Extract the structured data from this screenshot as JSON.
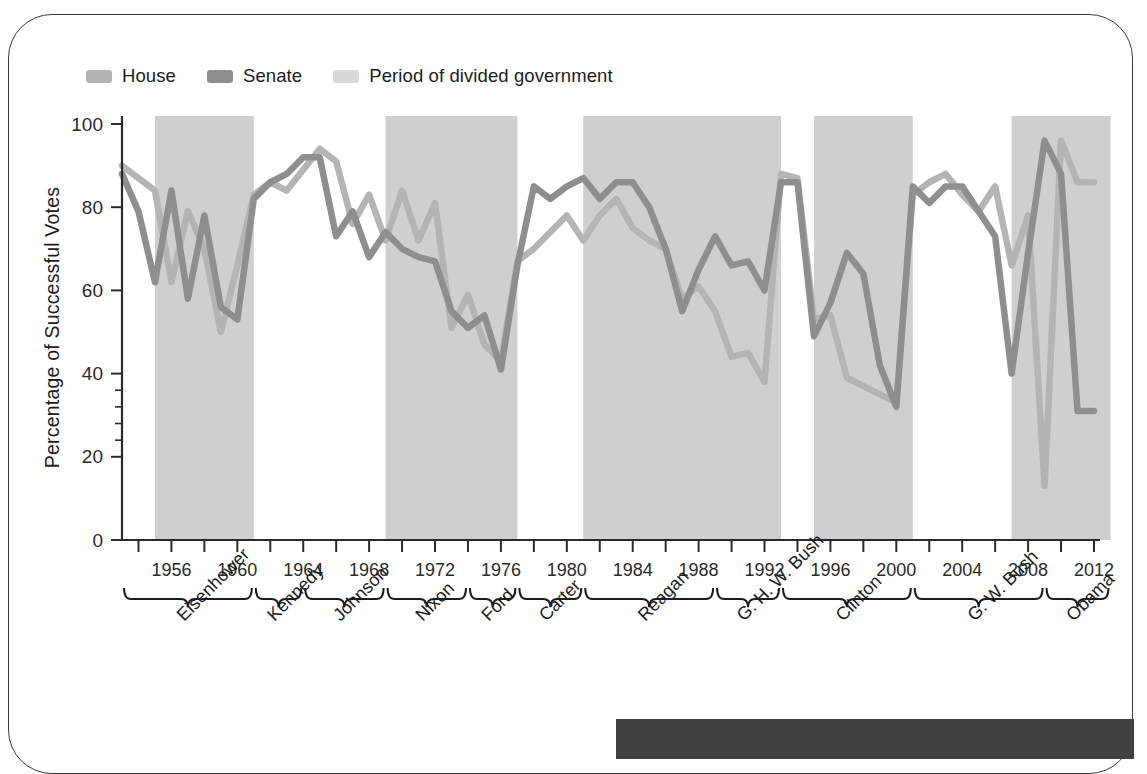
{
  "legend": {
    "items": [
      {
        "label": "House",
        "color": "#b4b4b4",
        "icon": "legend-swatch-house"
      },
      {
        "label": "Senate",
        "color": "#8e8e8e",
        "icon": "legend-swatch-senate"
      },
      {
        "label": "Period of divided government",
        "color": "#d8d8d8",
        "icon": "legend-swatch-divided"
      }
    ]
  },
  "axes": {
    "ylabel": "Percentage of Successful Votes",
    "yticks": [
      "0",
      "20",
      "40",
      "60",
      "80",
      "100"
    ],
    "xticks": [
      "1956",
      "1960",
      "1964",
      "1968",
      "1972",
      "1976",
      "1980",
      "1984",
      "1988",
      "1992",
      "1996",
      "2000",
      "2004",
      "2008",
      "2012"
    ]
  },
  "presidents": [
    {
      "name": "Eisenhower",
      "start": 1953,
      "end": 1961
    },
    {
      "name": "Kennedy",
      "start": 1961,
      "end": 1964
    },
    {
      "name": "Johnson",
      "start": 1964,
      "end": 1969
    },
    {
      "name": "Nixon",
      "start": 1969,
      "end": 1974
    },
    {
      "name": "Ford",
      "start": 1974,
      "end": 1977
    },
    {
      "name": "Carter",
      "start": 1977,
      "end": 1981
    },
    {
      "name": "Reagan",
      "start": 1981,
      "end": 1989
    },
    {
      "name": "G. H. W. Bush",
      "start": 1989,
      "end": 1993
    },
    {
      "name": "Clinton",
      "start": 1993,
      "end": 2001
    },
    {
      "name": "G. W. Bush",
      "start": 2001,
      "end": 2009
    },
    {
      "name": "Obama",
      "start": 2009,
      "end": 2013
    }
  ],
  "chart_data": {
    "type": "line",
    "title": "",
    "xlabel": "",
    "ylabel": "Percentage of Successful Votes",
    "xlim": [
      1953,
      2012
    ],
    "ylim": [
      0,
      100
    ],
    "grid": false,
    "legend_position": "top-left",
    "x": [
      1953,
      1954,
      1955,
      1956,
      1957,
      1958,
      1959,
      1960,
      1961,
      1962,
      1963,
      1964,
      1965,
      1966,
      1967,
      1968,
      1969,
      1970,
      1971,
      1972,
      1973,
      1974,
      1975,
      1976,
      1977,
      1978,
      1979,
      1980,
      1981,
      1982,
      1983,
      1984,
      1985,
      1986,
      1987,
      1988,
      1989,
      1990,
      1991,
      1992,
      1993,
      1994,
      1995,
      1996,
      1997,
      1998,
      1999,
      2000,
      2001,
      2002,
      2003,
      2004,
      2005,
      2006,
      2007,
      2008,
      2009,
      2010,
      2011,
      2012
    ],
    "series": [
      {
        "name": "House",
        "color": "#b4b4b4",
        "values": [
          90,
          87,
          84,
          62,
          79,
          70,
          50,
          66,
          83,
          86,
          84,
          89,
          94,
          91,
          76,
          83,
          72,
          84,
          72,
          81,
          51,
          59,
          47,
          43,
          67,
          70,
          74,
          78,
          72,
          78,
          82,
          75,
          72,
          70,
          58,
          61,
          55,
          44,
          45,
          38,
          88,
          87,
          53,
          54,
          39,
          37,
          35,
          33,
          83,
          86,
          88,
          83,
          79,
          85,
          66,
          78,
          13,
          96,
          86,
          86
        ],
        "unit": "percent"
      },
      {
        "name": "Senate",
        "color": "#8e8e8e",
        "values": [
          88,
          79,
          62,
          84,
          58,
          78,
          56,
          53,
          82,
          86,
          88,
          92,
          92,
          73,
          79,
          68,
          74,
          70,
          68,
          67,
          55,
          51,
          54,
          41,
          66,
          85,
          82,
          85,
          87,
          82,
          86,
          86,
          80,
          70,
          55,
          65,
          73,
          66,
          67,
          60,
          86,
          86,
          49,
          57,
          69,
          64,
          42,
          32,
          85,
          81,
          85,
          85,
          79,
          73,
          40,
          69,
          96,
          88,
          31,
          31
        ],
        "unit": "percent"
      }
    ],
    "shaded_regions": {
      "label": "Period of divided government",
      "color": "#cfcfcf",
      "spans": [
        [
          1955,
          1961
        ],
        [
          1969,
          1977
        ],
        [
          1981,
          1993
        ],
        [
          1995,
          2001
        ],
        [
          2007,
          2013
        ]
      ]
    }
  }
}
